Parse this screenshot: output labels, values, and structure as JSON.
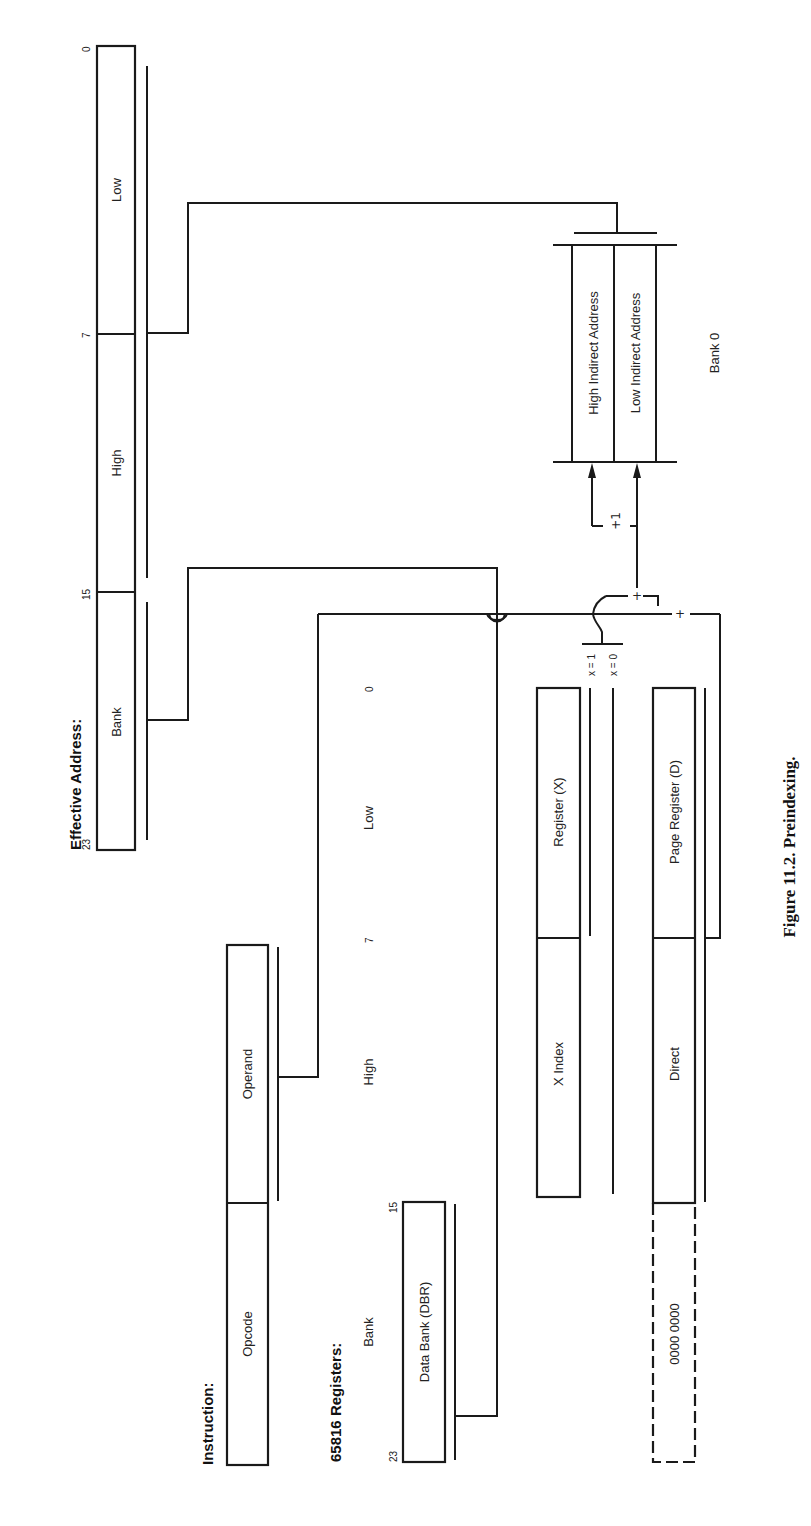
{
  "figure": {
    "caption": "Figure 11.2. Preindexing.",
    "orientation": "rotated 90° counter-clockwise on page"
  },
  "effective_address": {
    "title": "Effective Address:",
    "bit_labels": {
      "b23": "23",
      "b15": "15",
      "b7": "7",
      "b0": "0"
    },
    "fields": [
      "Bank",
      "High",
      "Low"
    ]
  },
  "instruction": {
    "title": "Instruction:",
    "fields": [
      "Opcode",
      "Operand"
    ]
  },
  "registers": {
    "title": "65816 Registers:",
    "column_headers": {
      "bank": "Bank",
      "high": "High",
      "low": "Low"
    },
    "bit_labels": {
      "b23": "23",
      "b15": "15",
      "b7": "7",
      "b0": "0"
    },
    "dbr": {
      "label": "Data Bank (DBR)"
    },
    "x_index": {
      "left": "X Index",
      "right": "Register (X)"
    },
    "direct": {
      "zero": "0000 0000",
      "left": "Direct",
      "right": "Page Register (D)"
    }
  },
  "bank0": {
    "label": "Bank 0",
    "cells": [
      "High Indirect Address",
      "Low Indirect Address"
    ]
  },
  "operators": {
    "plus1": "+1",
    "plus": "+",
    "x1": "x = 1",
    "x0": "x = 0"
  }
}
